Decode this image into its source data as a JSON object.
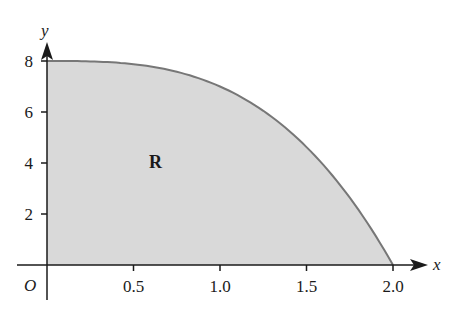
{
  "figure": {
    "region_label": "R",
    "origin_label": "O",
    "x_axis_label": "x",
    "y_axis_label": "y",
    "x_ticks": [
      {
        "value": 0.5,
        "label": "0.5"
      },
      {
        "value": 1.0,
        "label": "1.0"
      },
      {
        "value": 1.5,
        "label": "1.5"
      },
      {
        "value": 2.0,
        "label": "2.0"
      }
    ],
    "y_ticks": [
      {
        "value": 2,
        "label": "2"
      },
      {
        "value": 4,
        "label": "4"
      },
      {
        "value": 6,
        "label": "6"
      },
      {
        "value": 8,
        "label": "8"
      }
    ],
    "colors": {
      "fill": "#d9d9d9",
      "curve": "#777777",
      "axis": "#1a1a1a"
    }
  },
  "chart_data": {
    "type": "area",
    "title": "",
    "xlabel": "x",
    "ylabel": "y",
    "xlim": [
      0,
      2.0
    ],
    "ylim": [
      0,
      8
    ],
    "x": [
      0,
      0.25,
      0.5,
      0.75,
      1.0,
      1.25,
      1.5,
      1.75,
      2.0
    ],
    "values": [
      8,
      7.98,
      7.88,
      7.58,
      7.0,
      6.05,
      4.63,
      2.64,
      0
    ],
    "annotations": [
      {
        "text": "R",
        "x": 0.63,
        "y": 4
      }
    ],
    "grid": false
  }
}
